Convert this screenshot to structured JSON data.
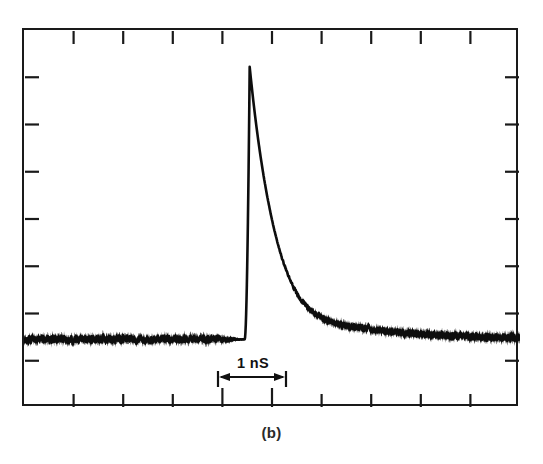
{
  "figure": {
    "caption": "(b)",
    "scale_bar": {
      "label": "1 nS",
      "arrow_icon": "double-headed-arrow-icon",
      "left_marker_icon": "vertical-bar-icon",
      "right_marker_icon": "vertical-bar-icon"
    },
    "colors": {
      "trace": "#0d0d0d",
      "frame": "#1a1a1a",
      "background": "#ffffff",
      "caption": "#2a2a2a"
    }
  },
  "chart_data": {
    "type": "line",
    "title": "(b)",
    "subtitle": "",
    "xlabel": "",
    "ylabel": "",
    "annotations": [
      {
        "text": "1 nS",
        "kind": "scale-bar",
        "x_start_div": 4.0,
        "x_end_div": 5.0,
        "note": "horizontal scale bar spanning one division = 1 nanosecond"
      }
    ],
    "grid": false,
    "legend": null,
    "axes": {
      "x_divisions": 10,
      "y_divisions": 8,
      "x_tick_count_interior": 9,
      "y_tick_count_interior": 7,
      "x_unit_per_division": "1 nS",
      "x_range_div": [
        0,
        10
      ],
      "y_range_div": [
        0,
        8
      ],
      "tick_direction": "inward",
      "tick_labels_x": [],
      "tick_labels_y": []
    },
    "series": [
      {
        "name": "pulse-trace",
        "style": "noisy-oscilloscope-band",
        "baseline_div": 1.45,
        "peak_div": {
          "x": 4.55,
          "y": 7.22
        },
        "rise_time_div": 0.1,
        "decay_constant_div": 0.55,
        "noise_amplitude_div": 0.11,
        "x": [
          0.0,
          0.2,
          0.4,
          0.6,
          0.8,
          1.0,
          1.2,
          1.4,
          1.6,
          1.8,
          2.0,
          2.2,
          2.4,
          2.6,
          2.8,
          3.0,
          3.2,
          3.4,
          3.6,
          3.8,
          4.0,
          4.2,
          4.4,
          4.46,
          4.5,
          4.55,
          4.62,
          4.7,
          4.8,
          4.9,
          5.0,
          5.1,
          5.2,
          5.35,
          5.5,
          5.65,
          5.8,
          6.0,
          6.2,
          6.4,
          6.6,
          6.8,
          7.0,
          7.25,
          7.5,
          7.75,
          8.0,
          8.25,
          8.5,
          8.75,
          9.0,
          9.25,
          9.5,
          9.75,
          10.0
        ],
        "y": [
          1.45,
          1.46,
          1.44,
          1.47,
          1.45,
          1.43,
          1.46,
          1.45,
          1.47,
          1.44,
          1.46,
          1.45,
          1.44,
          1.46,
          1.47,
          1.45,
          1.44,
          1.46,
          1.45,
          1.46,
          1.45,
          1.47,
          1.5,
          2.6,
          4.4,
          7.22,
          6.8,
          6.1,
          5.2,
          4.45,
          3.85,
          3.38,
          3.0,
          2.62,
          2.35,
          2.18,
          2.05,
          1.92,
          1.84,
          1.78,
          1.74,
          1.7,
          1.67,
          1.63,
          1.6,
          1.58,
          1.56,
          1.55,
          1.54,
          1.53,
          1.52,
          1.51,
          1.5,
          1.49,
          1.48
        ]
      }
    ]
  }
}
